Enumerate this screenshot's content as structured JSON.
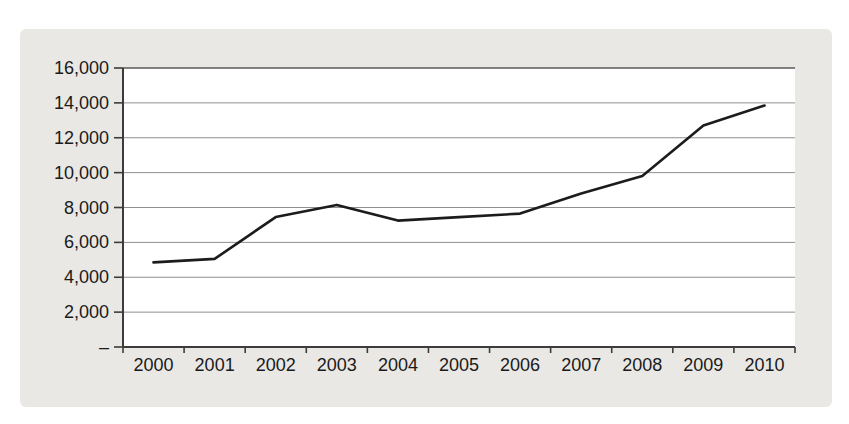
{
  "figure": {
    "title": "",
    "panel_bg": "#e9e8e4",
    "plot_bg": "#ffffff"
  },
  "chart_data": {
    "type": "line",
    "title": "",
    "subtitle": "",
    "xlabel": "",
    "ylabel": "",
    "categories": [
      "2000",
      "2001",
      "2002",
      "2003",
      "2004",
      "2005",
      "2006",
      "2007",
      "2008",
      "2009",
      "2010"
    ],
    "series": [
      {
        "name": "series-1",
        "values": [
          4850,
          5050,
          7450,
          8150,
          7250,
          7450,
          7650,
          8800,
          9800,
          12700,
          13850
        ]
      }
    ],
    "ylim": [
      0,
      16000
    ],
    "y_tick_step": 2000,
    "y_tick_labels": [
      "–",
      "2,000",
      "4,000",
      "6,000",
      "8,000",
      "10,000",
      "12,000",
      "14,000",
      "16,000"
    ],
    "grid": "horizontal",
    "legend": "none",
    "line_color": "#1c1c1c",
    "grid_color": "#8f8f8f",
    "top_grid_color": "#5a5a5a",
    "axis_color": "#3c3c3c",
    "label_color": "#1a1a1a"
  }
}
